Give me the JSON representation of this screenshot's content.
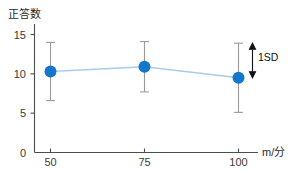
{
  "chart_data": {
    "type": "line",
    "title": "",
    "subtitle": "",
    "ylabel": "正答数",
    "xlabel": "m/分",
    "x": [
      50,
      75,
      100
    ],
    "categories": [
      "50",
      "75",
      "100"
    ],
    "values": [
      10.3,
      10.9,
      9.5
    ],
    "errors": [
      3.7,
      3.2,
      4.4
    ],
    "error_type": "1SD",
    "series": [
      {
        "name": "正答数",
        "values": [
          10.3,
          10.9,
          9.5
        ],
        "errors": [
          3.7,
          3.2,
          4.4
        ]
      }
    ],
    "ylim": [
      0,
      16
    ],
    "yticks": [
      0,
      5,
      10,
      15
    ],
    "ytick_labels": [
      "0",
      "5",
      "10",
      "15"
    ],
    "xticks": [
      50,
      75,
      100
    ],
    "xtick_labels": [
      "50",
      "75",
      "100"
    ],
    "grid": false,
    "legend": false,
    "annotations": [
      {
        "text": "1SD",
        "kind": "double-arrow",
        "at_x": 100,
        "from_value": 13.9,
        "to_value": 9.5
      }
    ],
    "colors": {
      "marker": "#1477cc",
      "line": "#a8cdea",
      "errorbar": "#9a9a9a",
      "axis": "#4d4d4d",
      "text": "#2b2b2b",
      "annotation": "#111111",
      "background": "#ffffff"
    }
  },
  "axis": {
    "y_title": "正答数",
    "x_title": "m/分"
  },
  "ticks": {
    "y": [
      "15",
      "10",
      "5",
      "0"
    ],
    "x": [
      "50",
      "75",
      "100"
    ]
  },
  "annotation": {
    "sd_label": "1SD"
  }
}
